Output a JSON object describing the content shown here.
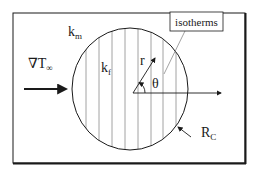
{
  "diagram": {
    "type": "physics-schematic",
    "labels": {
      "matrix_conductivity": {
        "base": "k",
        "sub": "m"
      },
      "inclusion_conductivity": {
        "base": "k",
        "sub": "f"
      },
      "far_field_gradient": {
        "base": "∇T",
        "sub": "∞"
      },
      "radial_coord": "r",
      "angle": "θ",
      "callout": "isotherms",
      "radius": {
        "base": "R",
        "sub": "C"
      }
    },
    "isotherm_count": 8,
    "colors": {
      "stroke": "#1a1a1a",
      "isotherm": "#8a8a8a",
      "background": "#ffffff"
    }
  }
}
